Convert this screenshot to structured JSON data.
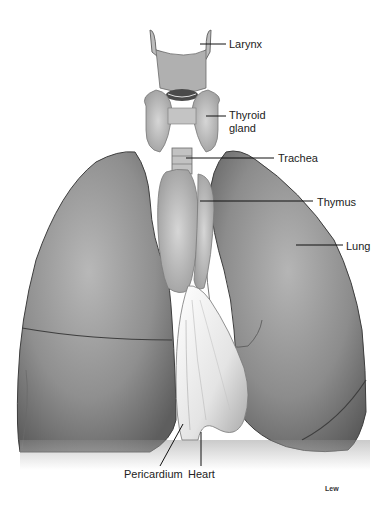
{
  "figure": {
    "style": "grayscale pencil illustration",
    "credit": "Lew"
  },
  "labels": [
    {
      "id": "larynx",
      "text": "Larynx",
      "x": 229,
      "y": 38,
      "line": [
        200,
        44,
        226,
        44
      ]
    },
    {
      "id": "thyroid",
      "text": "Thyroid",
      "text2": "gland",
      "x": 229,
      "y": 109,
      "line": [
        206,
        116,
        226,
        116
      ]
    },
    {
      "id": "trachea",
      "text": "Trachea",
      "x": 278,
      "y": 152,
      "line": [
        186,
        158,
        274,
        158
      ]
    },
    {
      "id": "thymus",
      "text": "Thymus",
      "x": 317,
      "y": 196,
      "line": [
        200,
        201,
        313,
        201
      ]
    },
    {
      "id": "lung",
      "text": "Lung",
      "x": 346,
      "y": 240,
      "line": [
        296,
        245,
        343,
        245
      ]
    },
    {
      "id": "pericardium",
      "text": "Pericardium",
      "x": 140,
      "y": 467,
      "line": [
        183,
        424,
        160,
        466
      ]
    },
    {
      "id": "heart",
      "text": "Heart",
      "x": 188,
      "y": 467,
      "line": [
        201,
        432,
        201,
        466
      ]
    }
  ]
}
